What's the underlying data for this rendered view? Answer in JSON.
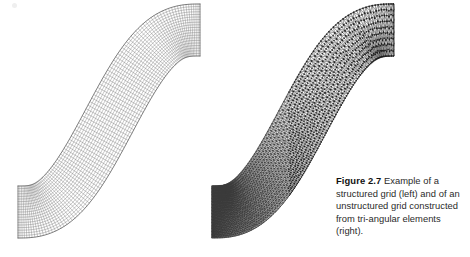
{
  "page": {
    "width": 470,
    "height": 257,
    "background": "#ffffff",
    "ink_color": "#3c3c3c",
    "text_color": "#2a2a2a"
  },
  "caption": {
    "label": "Figure 2.7",
    "separator": "  ",
    "body": "Example of a structured grid (left) and of an unstructured grid constructed from tri-angular elements (right).",
    "full_text": "Figure 2.7  Example of a structured grid (left) and of an unstructured grid constructed from tri-angular elements (right).",
    "lines": [
      "Figure 2.7  Example of a",
      "structured grid (left) and",
      "of an unstructured grid",
      "constructed from tri-",
      "angular elements (right)."
    ]
  },
  "figures": {
    "left": {
      "name": "structured-grid",
      "kind": "structured quadrilateral mesh",
      "description": "S-curved channel discretized into quadrilateral cells",
      "cells_along_channel": 96,
      "cells_across_channel": 20,
      "line_color": "#4a4a4a",
      "bounds": {
        "x": 14,
        "y": 4,
        "width": 196,
        "height": 232
      }
    },
    "right": {
      "name": "unstructured-grid",
      "kind": "unstructured triangular mesh",
      "description": "S-curved channel discretized into triangular elements, refined toward the lower-left inlet",
      "coarse_divisions_across": 9,
      "fine_divisions_across": 34,
      "line_color": "#3a3a3a",
      "node_color": "#1a1a1a",
      "bounds": {
        "x": 208,
        "y": 4,
        "width": 196,
        "height": 232
      }
    }
  },
  "channel_geometry": {
    "type": "sigmoid-band",
    "start_point": [
      18,
      212
    ],
    "end_point": [
      200,
      30
    ],
    "band_thickness": 52,
    "note": "Both panels share the same S-shaped channel outline, drawn left to right, rising from the lower-left to the upper-right."
  },
  "artifacts": [
    {
      "name": "scan-speck-top-left",
      "x": 12,
      "y": 3,
      "size": 5
    }
  ]
}
